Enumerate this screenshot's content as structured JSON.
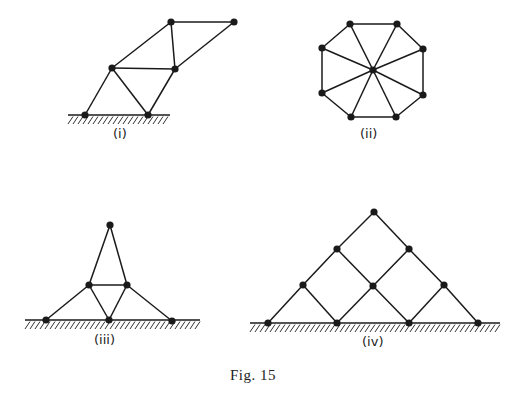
{
  "figure": {
    "caption": "Fig. 15",
    "stroke_color": "#1a1a1a",
    "panels": [
      {
        "id": "i",
        "label": "(i)",
        "label_pos": [
          113,
          138
        ],
        "nodes": [
          [
            85,
            115
          ],
          [
            148,
            115
          ],
          [
            112,
            68
          ],
          [
            175,
            69
          ],
          [
            171,
            22
          ],
          [
            234,
            22
          ]
        ],
        "edges": [
          [
            0,
            2
          ],
          [
            2,
            1
          ],
          [
            1,
            3
          ],
          [
            2,
            3
          ],
          [
            2,
            4
          ],
          [
            4,
            3
          ],
          [
            4,
            5
          ],
          [
            5,
            3
          ]
        ],
        "ground": {
          "x1": 68,
          "x2": 170,
          "y": 115
        }
      },
      {
        "id": "ii",
        "label": "(ii)",
        "label_pos": [
          360,
          138
        ],
        "nodes": [
          [
            350,
            24
          ],
          [
            397,
            24
          ],
          [
            423,
            49
          ],
          [
            423,
            95
          ],
          [
            396,
            117
          ],
          [
            351,
            117
          ],
          [
            322,
            93
          ],
          [
            322,
            48
          ],
          [
            373,
            70
          ]
        ],
        "edges": [
          [
            0,
            1
          ],
          [
            1,
            2
          ],
          [
            2,
            3
          ],
          [
            3,
            4
          ],
          [
            4,
            5
          ],
          [
            5,
            6
          ],
          [
            6,
            7
          ],
          [
            7,
            0
          ],
          [
            8,
            0
          ],
          [
            8,
            1
          ],
          [
            8,
            2
          ],
          [
            8,
            3
          ],
          [
            8,
            4
          ],
          [
            8,
            5
          ],
          [
            8,
            6
          ],
          [
            8,
            7
          ]
        ],
        "ground": null
      },
      {
        "id": "iii",
        "label": "(iii)",
        "label_pos": [
          94,
          344
        ],
        "nodes": [
          [
            110,
            225
          ],
          [
            89,
            285
          ],
          [
            127,
            285
          ],
          [
            46,
            320
          ],
          [
            109,
            320
          ],
          [
            172,
            321
          ]
        ],
        "edges": [
          [
            0,
            1
          ],
          [
            0,
            2
          ],
          [
            1,
            2
          ],
          [
            1,
            3
          ],
          [
            1,
            4
          ],
          [
            2,
            4
          ],
          [
            2,
            5
          ]
        ],
        "ground": {
          "x1": 25,
          "x2": 200,
          "y": 320
        }
      },
      {
        "id": "iv",
        "label": "(iv)",
        "label_pos": [
          362,
          346
        ],
        "nodes": [
          [
            374,
            212
          ],
          [
            337,
            249
          ],
          [
            409,
            249
          ],
          [
            303,
            285
          ],
          [
            373,
            286
          ],
          [
            444,
            285
          ],
          [
            268,
            323
          ],
          [
            337,
            323
          ],
          [
            409,
            323
          ],
          [
            478,
            323
          ]
        ],
        "edges": [
          [
            0,
            1
          ],
          [
            0,
            2
          ],
          [
            1,
            3
          ],
          [
            1,
            4
          ],
          [
            2,
            4
          ],
          [
            2,
            5
          ],
          [
            3,
            6
          ],
          [
            3,
            7
          ],
          [
            4,
            7
          ],
          [
            4,
            8
          ],
          [
            5,
            8
          ],
          [
            5,
            9
          ]
        ],
        "ground": {
          "x1": 250,
          "x2": 500,
          "y": 323
        }
      }
    ]
  }
}
